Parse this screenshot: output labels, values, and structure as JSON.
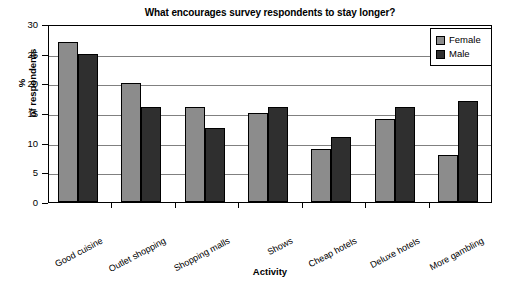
{
  "chart_data": {
    "type": "bar",
    "title": "What encourages survey respondents to stay longer?",
    "xlabel": "Activity",
    "ylabel_line1": "%",
    "ylabel_line2": "of respondents",
    "categories": [
      "Good cuisine",
      "Outlet shopping",
      "Shopping malls",
      "Shows",
      "Cheap hotels",
      "Deluxe hotels",
      "More gambling"
    ],
    "series": [
      {
        "name": "Female",
        "color": "#8c8c8c",
        "values": [
          27,
          20,
          16,
          15,
          9,
          14,
          8
        ]
      },
      {
        "name": "Male",
        "color": "#2f2f2f",
        "values": [
          25,
          16,
          12.5,
          16,
          11,
          16,
          17
        ]
      }
    ],
    "ylim": [
      0,
      30
    ],
    "ytick_values": [
      0,
      5,
      10,
      15,
      20,
      25,
      30
    ],
    "ytick_labels": [
      "0",
      "5",
      "10",
      "15",
      "20",
      "25",
      "30"
    ],
    "grid": true,
    "legend_position": "top-right"
  },
  "legend": {
    "entries": [
      {
        "label": "Female"
      },
      {
        "label": "Male"
      }
    ]
  }
}
